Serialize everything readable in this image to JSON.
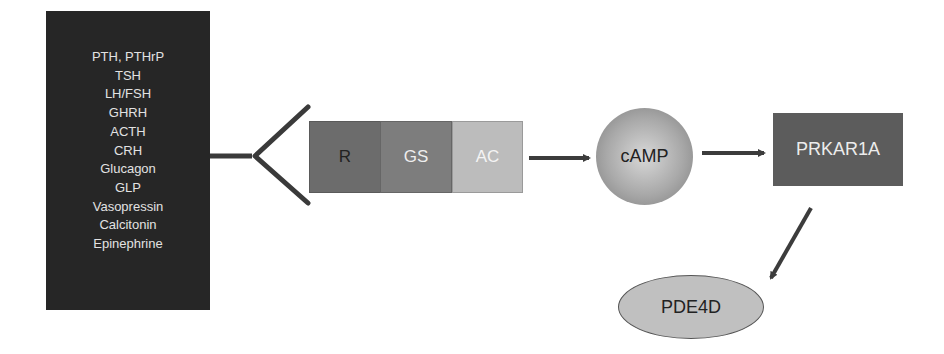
{
  "ligand_box": {
    "items": [
      "PTH, PTHrP",
      "TSH",
      "LH/FSH",
      "GHRH",
      "ACTH",
      "CRH",
      "Glucagon",
      "GLP",
      "Vasopressin",
      "Calcitonin",
      "Epinephrine"
    ],
    "color": "#262626"
  },
  "receptor_complex": {
    "segments": [
      {
        "label": "R",
        "color": "#6c6c6c"
      },
      {
        "label": "GS",
        "color": "#7d7d7d"
      },
      {
        "label": "AC",
        "color": "#bcbcbc"
      }
    ]
  },
  "nodes": {
    "camp": {
      "label": "cAMP",
      "shape": "circle"
    },
    "prkar1a": {
      "label": "PRKAR1A",
      "shape": "rectangle",
      "color": "#5c5c5c"
    },
    "pde4d": {
      "label": "PDE4D",
      "shape": "ellipse",
      "color": "#c0c0c0"
    }
  },
  "edges": [
    {
      "from": "ligand_box",
      "to": "receptor",
      "type": "line"
    },
    {
      "from": "receptor_complex",
      "to": "camp",
      "type": "arrow"
    },
    {
      "from": "camp",
      "to": "prkar1a",
      "type": "arrow"
    },
    {
      "from": "prkar1a",
      "to": "pde4d",
      "type": "arrow"
    }
  ]
}
